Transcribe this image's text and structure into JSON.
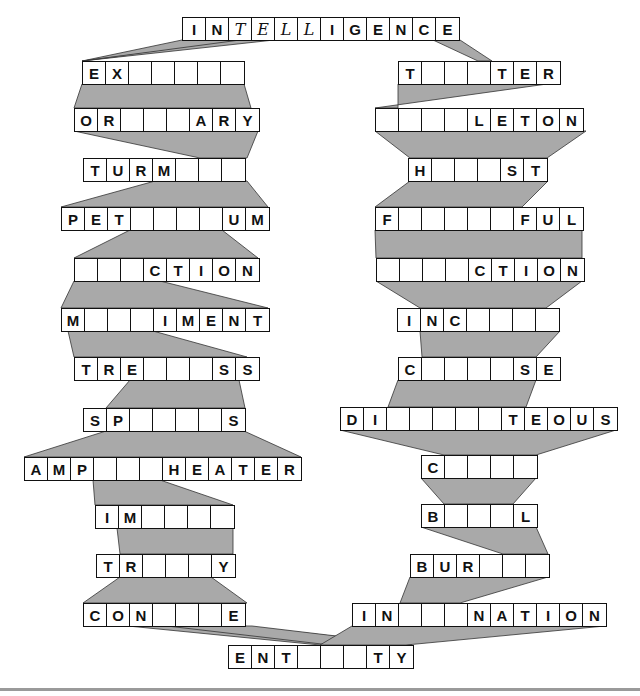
{
  "puzzle": {
    "top_word": {
      "cells": [
        "I",
        "N",
        "T",
        "E",
        "L",
        "L",
        "I",
        "G",
        "E",
        "N",
        "C",
        "E"
      ],
      "handwritten": [
        2,
        3,
        4,
        5
      ],
      "x": 182,
      "y": 17
    },
    "left_column": [
      {
        "cells": [
          "E",
          "X",
          "",
          "",
          "",
          "",
          ""
        ],
        "x": 82,
        "y": 61
      },
      {
        "cells": [
          "O",
          "R",
          "",
          "",
          "",
          "A",
          "R",
          "Y"
        ],
        "x": 74,
        "y": 108
      },
      {
        "cells": [
          "T",
          "U",
          "R",
          "M",
          "",
          "",
          ""
        ],
        "x": 83,
        "y": 158
      },
      {
        "cells": [
          "P",
          "E",
          "T",
          "",
          "",
          "",
          "",
          "U",
          "M"
        ],
        "x": 61,
        "y": 207
      },
      {
        "cells": [
          "",
          "",
          "",
          "C",
          "T",
          "I",
          "O",
          "N"
        ],
        "x": 74,
        "y": 258
      },
      {
        "cells": [
          "M",
          "",
          "",
          "",
          "I",
          "M",
          "E",
          "N",
          "T"
        ],
        "x": 61,
        "y": 308
      },
      {
        "cells": [
          "T",
          "R",
          "E",
          "",
          "",
          "",
          "S",
          "S"
        ],
        "x": 74,
        "y": 357
      },
      {
        "cells": [
          "S",
          "P",
          "",
          "",
          "",
          "",
          "S"
        ],
        "x": 83,
        "y": 408
      },
      {
        "cells": [
          "A",
          "M",
          "P",
          "",
          "",
          "",
          "H",
          "E",
          "A",
          "T",
          "E",
          "R"
        ],
        "x": 24,
        "y": 457
      },
      {
        "cells": [
          "I",
          "M",
          "",
          "",
          "",
          ""
        ],
        "x": 95,
        "y": 505
      },
      {
        "cells": [
          "T",
          "R",
          "",
          "",
          "",
          "Y"
        ],
        "x": 96,
        "y": 554
      },
      {
        "cells": [
          "C",
          "O",
          "N",
          "",
          "",
          "",
          "E"
        ],
        "x": 83,
        "y": 603
      }
    ],
    "right_column": [
      {
        "cells": [
          "T",
          "",
          "",
          "",
          "T",
          "E",
          "R"
        ],
        "x": 398,
        "y": 61
      },
      {
        "cells": [
          "",
          "",
          "",
          "",
          "L",
          "E",
          "T",
          "O",
          "N"
        ],
        "x": 375,
        "y": 108
      },
      {
        "cells": [
          "H",
          "",
          "",
          "",
          "S",
          "T"
        ],
        "x": 408,
        "y": 158
      },
      {
        "cells": [
          "F",
          "",
          "",
          "",
          "",
          "",
          "F",
          "U",
          "L"
        ],
        "x": 375,
        "y": 207
      },
      {
        "cells": [
          "",
          "",
          "",
          "",
          "C",
          "T",
          "I",
          "O",
          "N"
        ],
        "x": 376,
        "y": 258
      },
      {
        "cells": [
          "I",
          "N",
          "C",
          "",
          "",
          "",
          ""
        ],
        "x": 397,
        "y": 308
      },
      {
        "cells": [
          "C",
          "",
          "",
          "",
          "",
          "S",
          "E"
        ],
        "x": 398,
        "y": 357
      },
      {
        "cells": [
          "D",
          "I",
          "",
          "",
          "",
          "",
          "",
          "T",
          "E",
          "O",
          "U",
          "S"
        ],
        "x": 340,
        "y": 407
      },
      {
        "cells": [
          "C",
          "",
          "",
          "",
          ""
        ],
        "x": 421,
        "y": 455
      },
      {
        "cells": [
          "B",
          "",
          "",
          "",
          "L"
        ],
        "x": 421,
        "y": 504
      },
      {
        "cells": [
          "B",
          "U",
          "R",
          "",
          "",
          ""
        ],
        "x": 410,
        "y": 554
      },
      {
        "cells": [
          "I",
          "N",
          "",
          "",
          "",
          "N",
          "A",
          "T",
          "I",
          "O",
          "N"
        ],
        "x": 352,
        "y": 603
      }
    ],
    "bottom_word": {
      "cells": [
        "E",
        "N",
        "T",
        "",
        "",
        "",
        "T",
        "Y"
      ],
      "x": 228,
      "y": 645
    },
    "colors": {
      "connector_fill": "#a9a9a9",
      "box_border": "#111111",
      "background": "#ffffff"
    }
  },
  "connectors": [
    "182,40 251,40 82,61",
    "240,40 274,40 82,61",
    "433,40 460,40 492,61 478,61",
    "82,84 244,84 251,108 74,108",
    "74,131 258,131 247,158 200,158",
    "155,181 247,181 268,207 61,207",
    "130,230 222,230 258,258 74,258",
    "74,281 160,281 268,308 61,308",
    "68,331 153,331 247,357 74,357",
    "74,380 130,380 106,408 245,408 239,380",
    "106,431 244,431 301,457 24,457",
    "93,480 160,480 233,505 95,505",
    "117,528 233,528 233,554 120,554",
    "120,577 211,577 247,603 83,603",
    "128,626 243,626 412,645 320,645",
    "167,626 252,626 412,645 330,645",
    "398,84 420,84 547,84 375,108 398,108",
    "375,131 586,131 547,158 410,158",
    "410,181 548,181 522,207 375,207",
    "375,230 582,230 582,258 376,258",
    "376,281 582,281 546,308 420,308",
    "420,331 560,331 536,357 422,357",
    "398,380 536,380 526,407 388,407",
    "340,430 616,430 536,455 444,455",
    "421,478 536,478 513,504 444,504",
    "421,527 536,527 548,554 503,554",
    "410,577 548,577 460,603 400,603",
    "352,626 605,626 406,645 320,645"
  ]
}
